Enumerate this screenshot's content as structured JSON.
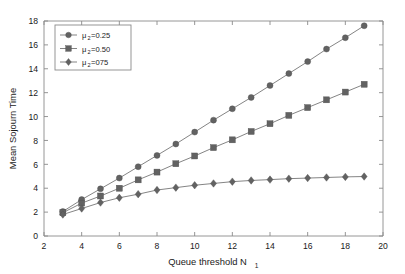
{
  "chart_data": {
    "type": "line",
    "title": "",
    "xlabel": "Queue threshold N",
    "xlabel_sub": "1",
    "ylabel": "Mean Sojourn Time",
    "xlim": [
      2,
      20
    ],
    "ylim": [
      0,
      18
    ],
    "xticks": [
      2,
      4,
      6,
      8,
      10,
      12,
      14,
      16,
      18,
      20
    ],
    "yticks": [
      0,
      2,
      4,
      6,
      8,
      10,
      12,
      14,
      16,
      18
    ],
    "xtick_labels": [
      "2",
      "4",
      "6",
      "8",
      "10",
      "12",
      "14",
      "16",
      "18",
      "20"
    ],
    "ytick_labels": [
      "0",
      "2",
      "4",
      "6",
      "8",
      "10",
      "12",
      "14",
      "16",
      "18"
    ],
    "grid": false,
    "legend_position": "upper-left",
    "x": [
      3,
      4,
      5,
      6,
      7,
      8,
      9,
      10,
      11,
      12,
      13,
      14,
      15,
      16,
      17,
      18,
      19
    ],
    "series": [
      {
        "name": "mu2=0.25",
        "legend_prefix": "μ",
        "legend_sub": "2",
        "legend_suffix": "=0.25",
        "marker": "circle",
        "color": "#626262",
        "values": [
          2.05,
          3.05,
          3.95,
          4.85,
          5.8,
          6.75,
          7.7,
          8.7,
          9.7,
          10.65,
          11.6,
          12.6,
          13.6,
          14.6,
          15.65,
          16.6,
          17.6
        ]
      },
      {
        "name": "mu2=0.50",
        "legend_prefix": "μ",
        "legend_sub": "2",
        "legend_suffix": "=0.50",
        "marker": "square",
        "color": "#626262",
        "values": [
          1.95,
          2.75,
          3.35,
          4.0,
          4.7,
          5.35,
          6.05,
          6.7,
          7.4,
          8.05,
          8.75,
          9.4,
          10.1,
          10.75,
          11.4,
          12.05,
          12.7
        ]
      },
      {
        "name": "mu2=075",
        "legend_prefix": "μ",
        "legend_sub": "2",
        "legend_suffix": "=075",
        "marker": "diamond",
        "color": "#626262",
        "values": [
          1.8,
          2.3,
          2.8,
          3.2,
          3.5,
          3.85,
          4.05,
          4.25,
          4.4,
          4.55,
          4.65,
          4.72,
          4.8,
          4.85,
          4.9,
          4.95,
          4.98
        ]
      }
    ]
  }
}
